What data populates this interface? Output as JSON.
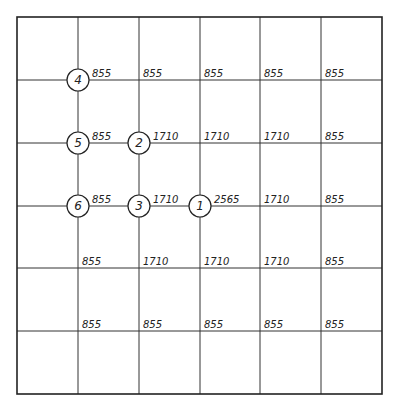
{
  "diagram": {
    "type": "grid-load-distribution",
    "grid": {
      "columns_x": [
        17,
        78,
        139,
        200,
        260,
        321,
        382
      ],
      "rows_y": [
        17,
        80,
        143,
        206,
        268,
        331,
        394
      ],
      "line_color": "#333333"
    },
    "nodes": [
      {
        "id": "4",
        "label": "4",
        "col": 1,
        "row": 1
      },
      {
        "id": "5",
        "label": "5",
        "col": 1,
        "row": 2
      },
      {
        "id": "2",
        "label": "2",
        "col": 2,
        "row": 2
      },
      {
        "id": "6",
        "label": "6",
        "col": 1,
        "row": 3
      },
      {
        "id": "3",
        "label": "3",
        "col": 2,
        "row": 3
      },
      {
        "id": "1",
        "label": "1",
        "col": 3,
        "row": 3
      }
    ],
    "values": [
      {
        "row": 1,
        "cells": [
          "855",
          "855",
          "855",
          "855",
          "855"
        ]
      },
      {
        "row": 2,
        "cells": [
          "855",
          "1710",
          "1710",
          "1710",
          "855"
        ]
      },
      {
        "row": 3,
        "cells": [
          "855",
          "1710",
          "2565",
          "1710",
          "855"
        ]
      },
      {
        "row": 4,
        "cells": [
          "855",
          "1710",
          "1710",
          "1710",
          "855"
        ]
      },
      {
        "row": 5,
        "cells": [
          "855",
          "855",
          "855",
          "855",
          "855"
        ]
      }
    ]
  }
}
